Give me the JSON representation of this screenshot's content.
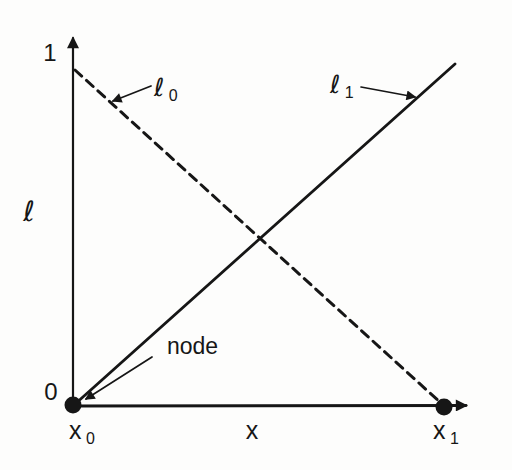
{
  "figure": {
    "background": "#fdfdfc",
    "ink": "#161616",
    "y_axis": {
      "symbol": "ℓ",
      "tick_top_label": "1",
      "tick_bottom_label": "0"
    },
    "x_axis": {
      "symbol": "x"
    },
    "functions": [
      {
        "id": "l0",
        "line_style": "dashed",
        "label_base": "ℓ",
        "label_sub": "0",
        "from": {
          "x": "x0",
          "value": 1
        },
        "to": {
          "x": "x1",
          "value": 0
        }
      },
      {
        "id": "l1",
        "line_style": "solid",
        "label_base": "ℓ",
        "label_sub": "1",
        "from": {
          "x": "x0",
          "value": 0
        },
        "to": {
          "x": "x1",
          "value": 1
        }
      }
    ],
    "nodes": [
      {
        "label_base": "x",
        "label_sub": "0"
      },
      {
        "label_base": "x",
        "label_sub": "1"
      }
    ],
    "annotations": {
      "node_pointer_label": "node"
    }
  }
}
